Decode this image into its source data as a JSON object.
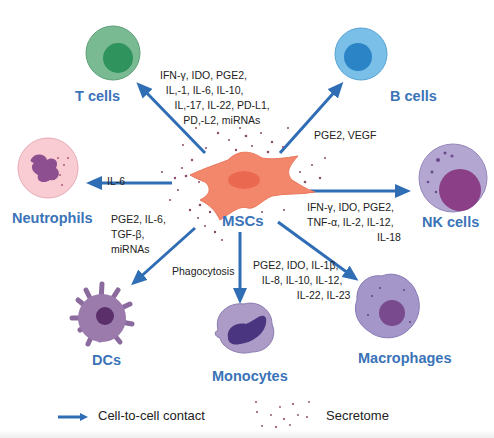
{
  "center": {
    "label": "MSCs"
  },
  "targets": [
    {
      "id": "t-cells",
      "label": "T cells",
      "factors": [
        "IFN-γ, IDO, PGE2,",
        "IL,-1, IL-6, IL-10,",
        "IL,-17, IL-22, PD-L1,",
        "PD,-L2, miRNAs"
      ]
    },
    {
      "id": "b-cells",
      "label": "B cells",
      "factors": [
        "PGE2, VEGF"
      ]
    },
    {
      "id": "neutrophils",
      "label": "Neutrophils",
      "factors": [
        "IL-6"
      ]
    },
    {
      "id": "nk-cells",
      "label": "NK cells",
      "factors": [
        "IFN-γ, IDO, PGE2,",
        "TNF-α, IL-2, IL-12,",
        "IL-18"
      ]
    },
    {
      "id": "dcs",
      "label": "DCs",
      "factors": [
        "PGE2, IL-6,",
        "TGF-β,",
        "miRNAs"
      ]
    },
    {
      "id": "monocytes",
      "label": "Monocytes",
      "factors": [
        "Phagocytosis"
      ]
    },
    {
      "id": "macrophages",
      "label": "Macrophages",
      "factors": [
        "PGE2, IDO, IL-1β,",
        "IL-8, IL-10, IL-12,",
        "IL-22, IL-23"
      ]
    }
  ],
  "text": {
    "t": "IFN-γ, IDO, PGE2,\n  IL,-1, IL-6, IL-10,\n     IL,-17, IL-22, PD-L1,\n        PD,-L2, miRNAs",
    "b": "PGE2, VEGF",
    "neu": "IL-6",
    "nk": "IFN-γ, IDO, PGE2,\nTNF-α, IL-2, IL-12,\n                        IL-18",
    "dc": "PGE2, IL-6,\nTGF-β,\nmiRNAs",
    "mono": "Phagocytosis",
    "mac": "PGE2, IDO, IL-1β,\n   IL-8, IL-10, IL-12,\n               IL-22, IL-23"
  },
  "legend": {
    "arrow_label": "Cell-to-cell contact",
    "dots_label": "Secretome"
  },
  "colors": {
    "arrow": "#2f6db5",
    "label": "#3a73b7",
    "msc": "#f2876c",
    "t_cell": "#6fb58a",
    "b_cell": "#6bb3e0",
    "neutrophil": "#f6c6cc",
    "nk_cell": "#a99bc9",
    "dc": "#8b6a9e",
    "monocyte": "#a897c4",
    "macrophage": "#9e8fc4"
  }
}
